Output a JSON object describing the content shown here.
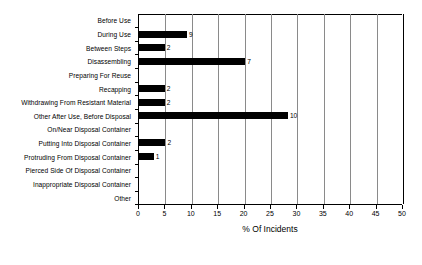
{
  "chart_data": {
    "type": "bar",
    "orientation": "horizontal",
    "title": "",
    "subtitle": "",
    "xlabel": "% Of Incidents",
    "ylabel": "",
    "xlim": [
      0,
      50
    ],
    "xticks": [
      0,
      5,
      10,
      15,
      20,
      25,
      30,
      35,
      40,
      45,
      50
    ],
    "grid": true,
    "legend": false,
    "bar_color": "#000000",
    "categories": [
      "Before Use",
      "During Use",
      "Between Steps",
      "Disassembling",
      "Preparing For Reuse",
      "Recapping",
      "Withdrawing From Resistant Material",
      "Other After Use, Before Disposal",
      "On/Near Disposal Container",
      "Putting Into Disposal Container",
      "Protruding From Disposal Container",
      "Pierced Side Of Disposal Container",
      "Inappropriate Disposal Container",
      "Other"
    ],
    "values": [
      0,
      9.1,
      4.9,
      20.1,
      0,
      4.9,
      4.9,
      28.2,
      0,
      5.0,
      2.8,
      0,
      0,
      0
    ],
    "data_labels": [
      "",
      "9",
      "2",
      "7",
      "",
      "2",
      "2",
      "10",
      "",
      "2",
      "1",
      "",
      "",
      ""
    ]
  }
}
